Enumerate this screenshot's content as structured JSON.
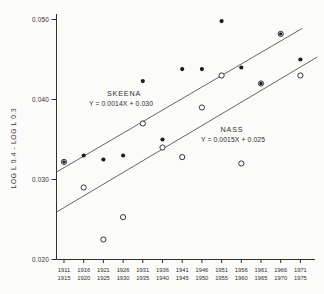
{
  "figure": {
    "background": "#fbfbf9",
    "ink_color": "#2f2f2f",
    "marker_color": "#1d1d1d",
    "line_color": "#555555"
  },
  "chart_data": {
    "type": "scatter",
    "title": "",
    "xlabel": "",
    "ylabel": "LOG L 0.4 - LOG L 0.3",
    "ylim": [
      0.02,
      0.05
    ],
    "yticks": [
      0.02,
      0.03,
      0.04,
      0.05
    ],
    "ytick_labels": [
      "0.020",
      "0.030",
      "0.040",
      "0.050"
    ],
    "grid": false,
    "legend_position": "inline-annotations",
    "categories": [
      [
        "1911",
        "1915"
      ],
      [
        "1916",
        "1920"
      ],
      [
        "1921",
        "1925"
      ],
      [
        "1926",
        "1930"
      ],
      [
        "1931",
        "1935"
      ],
      [
        "1936",
        "1940"
      ],
      [
        "1941",
        "1945"
      ],
      [
        "1946",
        "1950"
      ],
      [
        "1951",
        "1955"
      ],
      [
        "1956",
        "1960"
      ],
      [
        "1961",
        "1965"
      ],
      [
        "1966",
        "1970"
      ],
      [
        "1971",
        "1975"
      ]
    ],
    "series": [
      {
        "name": "SKEENA",
        "marker": "filled-circle",
        "equation": "Y = 0.0014X + 0.030",
        "values": [
          0.0322,
          0.033,
          0.0325,
          0.033,
          0.0423,
          0.035,
          0.0438,
          0.0438,
          0.0498,
          0.044,
          0.042,
          0.0482,
          0.045
        ]
      },
      {
        "name": "NASS",
        "marker": "open-circle",
        "equation": "Y = 0.0015X + 0.025",
        "values": [
          0.0322,
          0.029,
          0.0225,
          0.0253,
          0.037,
          0.034,
          0.0328,
          0.039,
          0.043,
          0.032,
          0.042,
          0.0482,
          0.043
        ]
      }
    ],
    "coincident_point_indices": [
      0,
      10,
      11
    ],
    "fit_lines": [
      {
        "series": "SKEENA",
        "x1": 0.6,
        "y1": 0.0309,
        "x2": 13.1,
        "y2": 0.0489
      },
      {
        "series": "NASS",
        "x1": 0.6,
        "y1": 0.0259,
        "x2": 13.85,
        "y2": 0.0453
      }
    ],
    "annotations": [
      {
        "id": "skeena-name",
        "text": "SKEENA",
        "x": 124,
        "y": 96,
        "size": 7.2,
        "spacing": 0.8
      },
      {
        "id": "skeena-eq",
        "text": "Y = 0.0014X + 0.030",
        "x": 121,
        "y": 106,
        "size": 6.8,
        "spacing": 0.1
      },
      {
        "id": "nass-name",
        "text": "NASS",
        "x": 232,
        "y": 132,
        "size": 7.2,
        "spacing": 0.8
      },
      {
        "id": "nass-eq",
        "text": "Y = 0.0015X + 0.025",
        "x": 233,
        "y": 142,
        "size": 6.8,
        "spacing": 0.1
      }
    ]
  }
}
